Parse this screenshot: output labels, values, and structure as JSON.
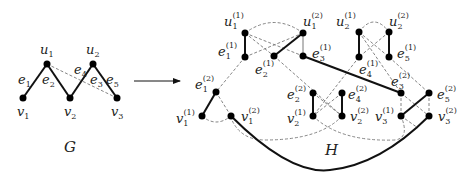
{
  "graph_g": {
    "title": "G",
    "nodes": [
      {
        "id": "u1",
        "label": "u",
        "sub": "1",
        "x": 47,
        "y": 64
      },
      {
        "id": "u2",
        "label": "u",
        "sub": "2",
        "x": 93,
        "y": 64
      },
      {
        "id": "v1",
        "label": "v",
        "sub": "1",
        "x": 23,
        "y": 98
      },
      {
        "id": "v2",
        "label": "v",
        "sub": "2",
        "x": 70,
        "y": 98
      },
      {
        "id": "v3",
        "label": "v",
        "sub": "3",
        "x": 117,
        "y": 98
      }
    ],
    "edges": [
      {
        "label": "e1",
        "from": "v1",
        "to": "u1",
        "style": "solid"
      },
      {
        "label": "e2",
        "from": "u1",
        "to": "v2",
        "style": "solid"
      },
      {
        "label": "e3",
        "from": "v2",
        "to": "u2",
        "style": "solid"
      },
      {
        "label": "e4",
        "from": "u1",
        "to": "v3",
        "style": "dashed"
      },
      {
        "label": "e5",
        "from": "u2",
        "to": "v3",
        "style": "solid"
      }
    ],
    "edge_labels": [
      "e1",
      "e2",
      "e3",
      "e4",
      "e5"
    ]
  },
  "arrow": {
    "from": [
      134,
      81
    ],
    "to": [
      181,
      81
    ]
  },
  "graph_h": {
    "title": "H",
    "nodes": [
      {
        "id": "u1_1",
        "base": "u",
        "sub": "1",
        "sup": "(1)"
      },
      {
        "id": "u1_2",
        "base": "u",
        "sub": "1",
        "sup": "(2)"
      },
      {
        "id": "u2_1",
        "base": "u",
        "sub": "2",
        "sup": "(1)"
      },
      {
        "id": "u2_2",
        "base": "u",
        "sub": "2",
        "sup": "(2)"
      },
      {
        "id": "e1_1",
        "base": "e",
        "sub": "1",
        "sup": "(1)"
      },
      {
        "id": "e2_1",
        "base": "e",
        "sub": "2",
        "sup": "(1)"
      },
      {
        "id": "e3_1",
        "base": "e",
        "sub": "3",
        "sup": "(1)"
      },
      {
        "id": "e4_1",
        "base": "e",
        "sub": "4",
        "sup": "(1)"
      },
      {
        "id": "e5_1",
        "base": "e",
        "sub": "5",
        "sup": "(1)"
      },
      {
        "id": "e1_2",
        "base": "e",
        "sub": "1",
        "sup": "(2)"
      },
      {
        "id": "e2_2",
        "base": "e",
        "sub": "2",
        "sup": "(2)"
      },
      {
        "id": "e3_2",
        "base": "e",
        "sub": "3",
        "sup": "(2)"
      },
      {
        "id": "e4_2",
        "base": "e",
        "sub": "4",
        "sup": "(2)"
      },
      {
        "id": "e5_2",
        "base": "e",
        "sub": "5",
        "sup": "(2)"
      },
      {
        "id": "v1_1",
        "base": "v",
        "sub": "1",
        "sup": "(1)"
      },
      {
        "id": "v1_2",
        "base": "v",
        "sub": "1",
        "sup": "(2)"
      },
      {
        "id": "v2_1",
        "base": "v",
        "sub": "2",
        "sup": "(1)"
      },
      {
        "id": "v2_2",
        "base": "v",
        "sub": "2",
        "sup": "(2)"
      },
      {
        "id": "v3_1",
        "base": "v",
        "sub": "3",
        "sup": "(1)"
      },
      {
        "id": "v3_2",
        "base": "v",
        "sub": "3",
        "sup": "(2)"
      }
    ]
  }
}
